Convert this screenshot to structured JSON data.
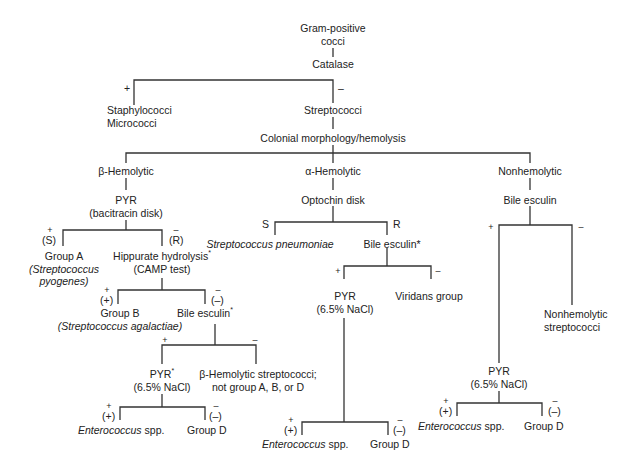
{
  "diagram": {
    "root": {
      "line1": "Gram-positive",
      "line2": "cocci"
    },
    "catalase": {
      "label": "Catalase",
      "positive_sign": "+",
      "negative_sign": "–",
      "positive_result": {
        "line1": "Staphylococci",
        "line2": "Micrococci"
      },
      "negative_result": "Streptococci"
    },
    "hemolysis": {
      "label": "Colonial morphology/hemolysis",
      "beta": "β-Hemolytic",
      "alpha": "α-Hemolytic",
      "non": "Nonhemolytic"
    },
    "beta_branch": {
      "test": {
        "line1": "PYR",
        "line2": "(bacitracin disk)"
      },
      "pos_sign": "+",
      "pos_paren": "(S)",
      "neg_sign": "–",
      "neg_paren": "(R)",
      "group_a": {
        "line1": "Group A",
        "line2": "(Streptococcus",
        "line3": "pyogenes)"
      },
      "hippurate": {
        "line1": "Hippurate hydrolysis",
        "asterisk": "*",
        "line2": "(CAMP test)"
      },
      "hip_pos_sign": "+",
      "hip_pos_paren": "(+)",
      "hip_neg_sign": "–",
      "hip_neg_paren": "(–)",
      "group_b": {
        "line1": "Group B",
        "line2": "(Streptococcus agalactiae)"
      },
      "bile_esculin": {
        "label": "Bile esculin",
        "asterisk": "*"
      },
      "be_pos_sign": "+",
      "be_neg_sign": "–",
      "pyr": {
        "line1": "PYR",
        "asterisk": "*",
        "line2": "(6.5% NaCl)"
      },
      "other_beta": {
        "line1": "β-Hemolytic streptococci;",
        "line2": "not group A, B, or D"
      },
      "pyr_pos_sign": "+",
      "pyr_pos_paren": "(+)",
      "pyr_neg_sign": "–",
      "pyr_neg_paren": "(–)",
      "enterococcus": {
        "genus": "Enterococcus",
        "suffix": " spp."
      },
      "group_d": "Group D"
    },
    "alpha_branch": {
      "test": "Optochin disk",
      "s_label": "S",
      "r_label": "R",
      "pneumoniae": "Streptococcus pneumoniae",
      "bile_esculin": "Bile esculin*",
      "be_pos_sign": "+",
      "be_neg_sign": "–",
      "pyr": {
        "line1": "PYR",
        "line2": "(6.5% NaCl)"
      },
      "viridans": "Viridans group",
      "pyr_pos_sign": "+",
      "pyr_pos_paren": "(+)",
      "pyr_neg_sign": "–",
      "pyr_neg_paren": "(–)",
      "enterococcus": {
        "genus": "Enterococcus",
        "suffix": " spp."
      },
      "group_d": "Group D"
    },
    "non_branch": {
      "test": "Bile esculin",
      "pos_sign": "+",
      "neg_sign": "–",
      "nonhemolytic": {
        "line1": "Nonhemolytic",
        "line2": "streptococci"
      },
      "pyr": {
        "line1": "PYR",
        "line2": "(6.5% NaCl)"
      },
      "pyr_pos_sign": "+",
      "pyr_pos_paren": "(+)",
      "pyr_neg_sign": "–",
      "pyr_neg_paren": "(–)",
      "enterococcus": {
        "genus": "Enterococcus",
        "suffix": " spp."
      },
      "group_d": "Group D"
    },
    "line_color": "#333333"
  }
}
